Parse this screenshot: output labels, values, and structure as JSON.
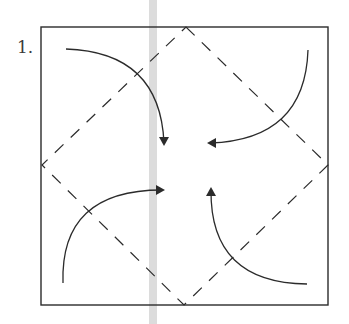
{
  "step": {
    "label": "1."
  },
  "diagram": {
    "type": "origami-fold-step",
    "paper_square": {
      "x1": 41,
      "y1": 27,
      "x2": 328,
      "y2": 305
    },
    "diamond_vertices": [
      [
        186,
        27
      ],
      [
        328,
        165
      ],
      [
        184,
        305
      ],
      [
        42,
        165
      ]
    ],
    "fold_line_style": "dashed",
    "arrows": [
      {
        "id": "top-left",
        "start": [
          66,
          49
        ],
        "control": [
          160,
          52
        ],
        "end": [
          164,
          143
        ],
        "direction": "down"
      },
      {
        "id": "top-right",
        "start": [
          308,
          50
        ],
        "control": [
          305,
          140
        ],
        "end": [
          210,
          143
        ],
        "direction": "left"
      },
      {
        "id": "bottom-left",
        "start": [
          63,
          283
        ],
        "control": [
          60,
          190
        ],
        "end": [
          162,
          190
        ],
        "direction": "right"
      },
      {
        "id": "bottom-right",
        "start": [
          307,
          284
        ],
        "control": [
          210,
          283
        ],
        "end": [
          211,
          190
        ],
        "direction": "up"
      }
    ],
    "colors": {
      "line": "#2b2b2b",
      "gutter_bar": "#dcdcdc"
    },
    "gutter_bar": {
      "x": 149,
      "width": 8
    }
  }
}
